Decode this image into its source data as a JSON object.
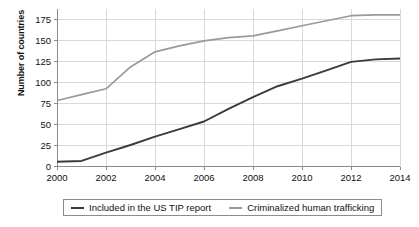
{
  "chart_data": {
    "type": "line",
    "title": "",
    "xlabel": "",
    "ylabel": "Number of countries",
    "xlim": [
      2000,
      2014
    ],
    "ylim": [
      0,
      187
    ],
    "grid": true,
    "legend_position": "bottom",
    "x": [
      2000,
      2001,
      2002,
      2003,
      2004,
      2005,
      2006,
      2007,
      2008,
      2009,
      2010,
      2011,
      2012,
      2013,
      2014
    ],
    "xticks": [
      "2000",
      "2002",
      "2004",
      "2006",
      "2008",
      "2010",
      "2012",
      "2014"
    ],
    "xtick_values": [
      2000,
      2002,
      2004,
      2006,
      2008,
      2010,
      2012,
      2014
    ],
    "yticks": [
      "0",
      "25",
      "50",
      "75",
      "100",
      "125",
      "150",
      "175"
    ],
    "ytick_values": [
      0,
      25,
      50,
      75,
      100,
      125,
      150,
      175
    ],
    "series": [
      {
        "name": "Included in the US TIP report",
        "color": "#3b3b3b",
        "values": [
          5,
          6,
          16,
          25,
          35,
          44,
          53,
          68,
          82,
          95,
          104,
          114,
          124,
          127,
          128
        ]
      },
      {
        "name": "Criminalized human trafficking",
        "color": "#9a9a9a",
        "values": [
          78,
          85,
          92,
          118,
          136,
          143,
          149,
          153,
          155,
          161,
          167,
          173,
          179,
          180,
          180
        ]
      }
    ]
  },
  "legend": {
    "items": [
      {
        "label": "Included in the US TIP report",
        "color": "#3b3b3b"
      },
      {
        "label": "Criminalized human trafficking",
        "color": "#9a9a9a"
      }
    ]
  },
  "axes": {
    "y_title": "Number of countries"
  }
}
